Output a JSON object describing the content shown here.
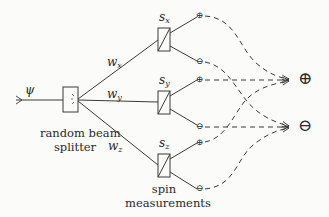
{
  "input": {
    "label": "ψ"
  },
  "splitter": {
    "caption_line1": "random beam",
    "caption_line2": "splitter"
  },
  "weights": [
    {
      "id": "wx",
      "base": "w",
      "sub": "x"
    },
    {
      "id": "wy",
      "base": "w",
      "sub": "y"
    },
    {
      "id": "wz",
      "base": "w",
      "sub": "z"
    }
  ],
  "detectors": [
    {
      "id": "sx",
      "base": "s",
      "sub": "x",
      "plus": "⊕",
      "minus": "⊖"
    },
    {
      "id": "sy",
      "base": "s",
      "sub": "y",
      "plus": "⊕",
      "minus": "⊖"
    },
    {
      "id": "sz",
      "base": "s",
      "sub": "z",
      "plus": "⊕",
      "minus": "⊖"
    }
  ],
  "detector_caption": {
    "line1": "spin",
    "line2": "measurements"
  },
  "outputs": {
    "plus": "⊕",
    "minus": "⊖"
  },
  "colors": {
    "stroke": "#3a3a3a",
    "background": "#fbfbf9"
  }
}
